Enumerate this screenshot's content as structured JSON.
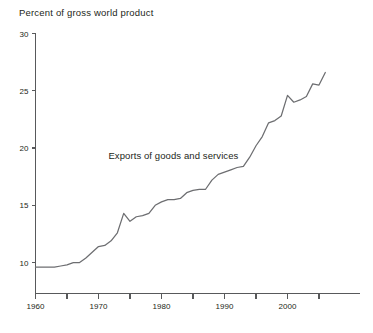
{
  "chart_data": {
    "type": "line",
    "title": "Percent of gross world product",
    "xlabel": "",
    "ylabel": "Percent of gross world product",
    "xlim": [
      1960,
      2006
    ],
    "ylim": [
      7.3,
      30
    ],
    "grid": false,
    "legend_position": "inline-annotation",
    "annotations": [
      {
        "text": "Exports of goods and services",
        "x": 1983,
        "y": 19.2
      }
    ],
    "x_ticks_major": [
      1960,
      1970,
      1980,
      1990,
      2000
    ],
    "x_tick_labels": [
      "1960",
      "1970",
      "1980",
      "1990",
      "2000"
    ],
    "x_ticks_minor": [
      1965,
      1975,
      1985,
      1995,
      2005
    ],
    "y_ticks": [
      10,
      15,
      20,
      25,
      30
    ],
    "y_tick_labels": [
      "10",
      "15",
      "20",
      "25",
      "30"
    ],
    "series": [
      {
        "name": "Exports of goods and services",
        "color": "#6d6e71",
        "x": [
          1960,
          1961,
          1962,
          1963,
          1964,
          1965,
          1966,
          1967,
          1968,
          1969,
          1970,
          1971,
          1972,
          1973,
          1974,
          1975,
          1976,
          1977,
          1978,
          1979,
          1980,
          1981,
          1982,
          1983,
          1984,
          1985,
          1986,
          1987,
          1988,
          1989,
          1990,
          1991,
          1992,
          1993,
          1994,
          1995,
          1996,
          1997,
          1998,
          1999,
          2000,
          2001,
          2002,
          2003,
          2004,
          2005,
          2006
        ],
        "values": [
          9.6,
          9.6,
          9.6,
          9.6,
          9.7,
          9.8,
          10.0,
          10.0,
          10.4,
          10.9,
          11.4,
          11.5,
          11.9,
          12.6,
          14.3,
          13.6,
          14.0,
          14.1,
          14.3,
          15.0,
          15.3,
          15.5,
          15.5,
          15.6,
          16.1,
          16.3,
          16.4,
          16.4,
          17.2,
          17.7,
          17.9,
          18.1,
          18.3,
          18.4,
          19.2,
          20.2,
          21.0,
          22.2,
          22.4,
          22.8,
          24.6,
          24.0,
          24.2,
          24.5,
          25.6,
          25.5,
          26.6
        ]
      }
    ]
  }
}
